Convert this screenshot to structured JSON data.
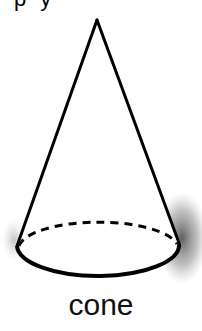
{
  "top_fragment": {
    "text": "py"
  },
  "figure": {
    "shape": "cone",
    "apex": [
      97,
      20
    ],
    "base_ellipse": {
      "cx": 98,
      "cy": 249,
      "rx": 81,
      "ry": 29
    },
    "stroke_color": "#000000",
    "shadow_color": "#555555",
    "hidden_edge_style": "dashed"
  },
  "label": "cone"
}
